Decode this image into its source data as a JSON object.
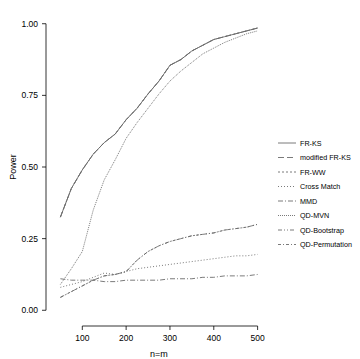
{
  "chart_data": {
    "type": "line",
    "title": "",
    "xlabel": "n=m",
    "ylabel": "Power",
    "xlim": [
      40,
      510
    ],
    "ylim": [
      -0.02,
      1.02
    ],
    "grid": false,
    "legend_position": "right",
    "xticks": [
      100,
      200,
      300,
      400,
      500
    ],
    "xtick_labels": [
      "100",
      "200",
      "300",
      "400",
      "500"
    ],
    "yticks": [
      0.0,
      0.25,
      0.5,
      0.75,
      1.0
    ],
    "ytick_labels": [
      "0.00",
      "0.25",
      "0.50",
      "0.75",
      "1.00"
    ],
    "x": [
      50,
      75,
      100,
      125,
      150,
      175,
      200,
      225,
      250,
      275,
      300,
      325,
      350,
      375,
      400,
      425,
      450,
      475,
      500
    ],
    "series": [
      {
        "name": "FR-KS",
        "color": "#6b6b6b",
        "dash": "none",
        "values": [
          0.325,
          0.425,
          0.49,
          0.545,
          0.585,
          0.615,
          0.665,
          0.705,
          0.755,
          0.8,
          0.855,
          0.875,
          0.905,
          0.925,
          0.945,
          0.955,
          0.965,
          0.975,
          0.985
        ]
      },
      {
        "name": "modified FR-KS",
        "color": "#6b6b6b",
        "dash": "6,3",
        "values": [
          0.325,
          0.425,
          0.49,
          0.545,
          0.585,
          0.615,
          0.665,
          0.705,
          0.755,
          0.8,
          0.855,
          0.875,
          0.905,
          0.925,
          0.945,
          0.955,
          0.965,
          0.975,
          0.985
        ]
      },
      {
        "name": "FR-WW",
        "color": "#6b6b6b",
        "dash": "2,2",
        "values": [
          0.325,
          0.425,
          0.49,
          0.545,
          0.585,
          0.615,
          0.665,
          0.705,
          0.755,
          0.8,
          0.855,
          0.875,
          0.905,
          0.925,
          0.945,
          0.955,
          0.965,
          0.975,
          0.985
        ]
      },
      {
        "name": "Cross Match",
        "color": "#6b6b6b",
        "dash": "1,2",
        "values": [
          0.08,
          0.09,
          0.1,
          0.115,
          0.13,
          0.125,
          0.135,
          0.145,
          0.15,
          0.155,
          0.16,
          0.165,
          0.17,
          0.175,
          0.18,
          0.185,
          0.19,
          0.19,
          0.195
        ]
      },
      {
        "name": "MMD",
        "color": "#6b6b6b",
        "dash": "5,2,1,2",
        "values": [
          0.11,
          0.105,
          0.105,
          0.105,
          0.1,
          0.1,
          0.105,
          0.105,
          0.105,
          0.105,
          0.11,
          0.11,
          0.11,
          0.115,
          0.115,
          0.12,
          0.12,
          0.12,
          0.125
        ]
      },
      {
        "name": "QD-MVN",
        "color": "#6b6b6b",
        "dash": "1,1",
        "values": [
          0.09,
          0.145,
          0.205,
          0.35,
          0.455,
          0.525,
          0.6,
          0.655,
          0.705,
          0.755,
          0.8,
          0.835,
          0.865,
          0.895,
          0.915,
          0.935,
          0.95,
          0.965,
          0.975
        ]
      },
      {
        "name": "QD-Bootstrap",
        "color": "#6b6b6b",
        "dash": "4,2,1,2,1,2",
        "values": [
          0.045,
          0.065,
          0.085,
          0.105,
          0.12,
          0.125,
          0.135,
          0.175,
          0.205,
          0.225,
          0.24,
          0.25,
          0.26,
          0.265,
          0.27,
          0.28,
          0.285,
          0.29,
          0.3
        ]
      },
      {
        "name": "QD-Permutation",
        "color": "#6b6b6b",
        "dash": "3,2,1,2",
        "values": [
          0.045,
          0.065,
          0.085,
          0.105,
          0.12,
          0.125,
          0.135,
          0.175,
          0.205,
          0.225,
          0.24,
          0.25,
          0.26,
          0.265,
          0.27,
          0.28,
          0.285,
          0.29,
          0.3
        ]
      }
    ],
    "legend_entries": [
      {
        "label": "FR-KS",
        "dash": "none"
      },
      {
        "label": "modified FR-KS",
        "dash": "6,3"
      },
      {
        "label": "FR-WW",
        "dash": "2,2"
      },
      {
        "label": "Cross Match",
        "dash": "1,2"
      },
      {
        "label": "MMD",
        "dash": "5,2,1,2"
      },
      {
        "label": "QD-MVN",
        "dash": "1,1"
      },
      {
        "label": "QD-Bootstrap",
        "dash": "4,2,1,2,1,2"
      },
      {
        "label": "QD-Permutation",
        "dash": "3,2,1,2"
      }
    ]
  }
}
